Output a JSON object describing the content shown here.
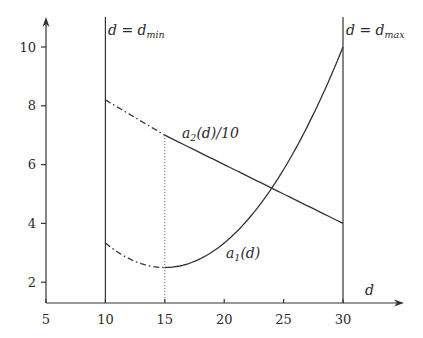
{
  "chart_data": {
    "type": "line",
    "title": "",
    "xlabel": "d",
    "ylabel": "",
    "xlim": [
      5,
      32.5
    ],
    "ylim": [
      1.3,
      10.8
    ],
    "x_ticks": [
      5,
      10,
      15,
      20,
      25,
      30
    ],
    "y_ticks": [
      2,
      4,
      6,
      8,
      10
    ],
    "grid": false,
    "legend": "none (inline curve labels)",
    "series": [
      {
        "name": "a_1(d)",
        "label": "a₁(d)",
        "style": "dash-dot for 10≤d<15, solid for 15≤d≤30",
        "x": [
          10,
          12,
          14,
          15,
          17,
          20,
          22,
          24,
          26,
          28,
          30
        ],
        "values": [
          3.33,
          2.8,
          2.53,
          2.5,
          2.63,
          3.33,
          4.13,
          5.2,
          6.53,
          8.13,
          10.0
        ]
      },
      {
        "name": "a_2(d)/10",
        "label": "a₂(d)/10",
        "style": "dash-dot for 10≤d<15, solid for 15≤d≤30",
        "x": [
          10,
          15,
          20,
          22.5,
          25,
          30
        ],
        "values": [
          8.2,
          7.0,
          6.0,
          5.5,
          5.0,
          4.0
        ]
      }
    ],
    "vertical_lines": [
      {
        "x": 10,
        "label": "d = d_min",
        "style": "solid"
      },
      {
        "x": 30,
        "label": "d = d_max",
        "style": "solid"
      },
      {
        "x": 15,
        "label": "",
        "style": "dotted",
        "from_y": 1.3,
        "to_y": 7.0
      }
    ],
    "annotations": [
      {
        "text": "a₂(d)/10",
        "x": 16.1,
        "y": 6.7
      },
      {
        "text": "a₁(d)",
        "x": 20.0,
        "y": 2.6
      },
      {
        "text": "d = d_min",
        "x": 10.2,
        "y": 10.4
      },
      {
        "text": "d = d_max",
        "x": 30.2,
        "y": 10.4
      },
      {
        "text": "d",
        "x": 31.8,
        "y": 1.7
      }
    ],
    "intersection": {
      "x": 23.9,
      "y": 5.15
    }
  },
  "labels": {
    "x_axis": "d",
    "dmin": {
      "main": "d = d",
      "sub": "min"
    },
    "dmax": {
      "main": "d = d",
      "sub": "max"
    },
    "a2": {
      "main": "a",
      "sub": "2",
      "rest": "(d)/10"
    },
    "a1": {
      "main": "a",
      "sub": "1",
      "rest": "(d)"
    }
  },
  "ticks": {
    "x": [
      "5",
      "10",
      "15",
      "20",
      "25",
      "30"
    ],
    "y": [
      "2",
      "4",
      "6",
      "8",
      "10"
    ]
  }
}
